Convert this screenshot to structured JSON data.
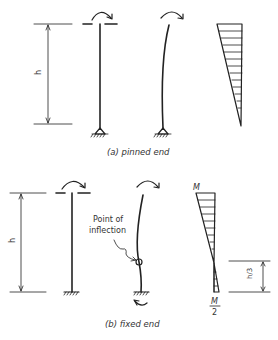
{
  "panels": [
    {
      "id": "a",
      "caption": "(a) pinned end",
      "dimension_label": "h",
      "support": "pinned",
      "moment_diagram": {
        "top_label": "",
        "bottom_label": ""
      }
    },
    {
      "id": "b",
      "caption": "(b) fixed end",
      "dimension_label": "h",
      "support": "fixed",
      "annotation": "Point of inflection",
      "annotation_line1": "Point of",
      "annotation_line2": "inflection",
      "moment_diagram": {
        "top_label": "M",
        "bottom_label_num": "M",
        "bottom_label_den": "2",
        "inflection_dim_label": "h/3"
      }
    }
  ],
  "colors": {
    "ink": "#222222",
    "background": "#ffffff"
  }
}
